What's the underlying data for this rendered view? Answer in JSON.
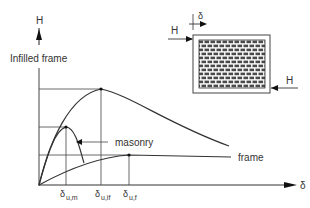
{
  "axes": {
    "y_label": "H",
    "x_label": "δ"
  },
  "curve_labels": {
    "infilled": "Infilled frame",
    "masonry": "masonry",
    "frame": "frame"
  },
  "x_ticks": [
    {
      "main": "δ",
      "sub": "u,m"
    },
    {
      "main": "δ",
      "sub": "u,if"
    },
    {
      "main": "δ",
      "sub": "u,f"
    }
  ],
  "inset": {
    "load_top": "H",
    "load_bottom": "H",
    "displacement": "δ"
  },
  "colors": {
    "line": "#333333",
    "grid": "#444444"
  }
}
